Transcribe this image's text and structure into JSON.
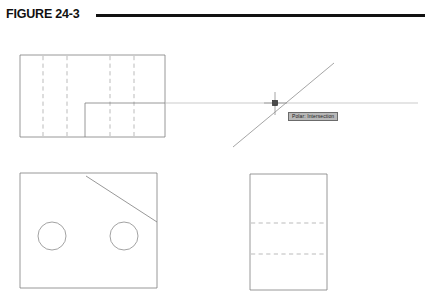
{
  "page": {
    "background_color": "#ffffff",
    "width": 425,
    "height": 298
  },
  "header": {
    "figure_label": "FIGURE 24-3",
    "rule_color": "#111111"
  },
  "tooltip": {
    "name": "polar-intersection-tooltip",
    "text": "Polar: Intersection",
    "background_color": "#b8b8b8",
    "border_color": "#6b6b6b",
    "text_color": "#1c1c1c"
  },
  "colors": {
    "object_line": "#7d7d7d",
    "hidden_line": "#a9a9a9",
    "tracking_line": "#b6b6b6",
    "crosshair": "#9a9a9a",
    "snap_marker": "#4a4a4a"
  },
  "views": {
    "top_view": {
      "name": "Top orthographic view with step and hidden lines",
      "outline": {
        "x": 20,
        "y": 55,
        "width": 145,
        "height": 82
      },
      "hidden_vertical_lines_x": [
        43,
        67,
        110,
        134
      ],
      "step": {
        "x": 85,
        "y": 103,
        "width": 80,
        "height": 34
      }
    },
    "front_view": {
      "name": "Front orthographic view with two holes and chamfer",
      "outline": {
        "x": 20,
        "y": 173,
        "width": 137,
        "height": 115
      },
      "chamfer": {
        "x1": 86,
        "y1": 176,
        "x2": 157,
        "y2": 222
      },
      "circles": [
        {
          "cx": 52,
          "cy": 236,
          "r": 14
        },
        {
          "cx": 124,
          "cy": 236,
          "r": 14
        }
      ]
    },
    "side_view": {
      "name": "Side orthographic view with two hidden lines",
      "outline": {
        "x": 250,
        "y": 174,
        "width": 77,
        "height": 116
      },
      "hidden_horizontal_lines_y": [
        223,
        254
      ]
    }
  },
  "polar_tracking": {
    "name": "Polar tracking intersection snap",
    "intersection_point": {
      "x": 275,
      "y": 103
    },
    "horizontal_track": {
      "x1": 85,
      "y1": 103,
      "x2": 418,
      "y2": 103
    },
    "polar_ray": {
      "x1": 233,
      "y1": 147,
      "x2": 334,
      "y2": 63
    },
    "crosshair_size": 18,
    "snap_marker_size": 5
  }
}
